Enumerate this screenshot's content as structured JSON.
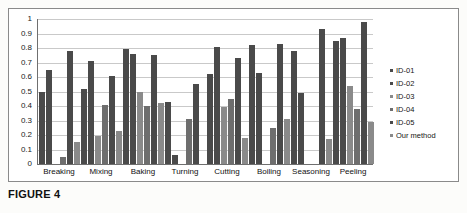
{
  "caption": "FIGURE 4",
  "chart_data": {
    "type": "bar",
    "title": "",
    "xlabel": "",
    "ylabel": "",
    "ylim": [
      0,
      1
    ],
    "yticks": [
      "1",
      "0.9",
      "0.8",
      "0.7",
      "0.6",
      "0.5",
      "0.4",
      "0.3",
      "0.2",
      "0.1",
      "0"
    ],
    "ytick_values": [
      1,
      0.9,
      0.8,
      0.7,
      0.6,
      0.5,
      0.4,
      0.3,
      0.2,
      0.1,
      0
    ],
    "grid": true,
    "legend_position": "right",
    "categories": [
      "Breaking",
      "Mixing",
      "Baking",
      "Turning",
      "Cutting",
      "Boiling",
      "Seasoning",
      "Peeling"
    ],
    "series": [
      {
        "name": "ID-01",
        "color": "#4a4a4a",
        "values": [
          0.5,
          0.52,
          0.79,
          0.43,
          0.62,
          0.82,
          0.78,
          0.85
        ]
      },
      {
        "name": "ID-02",
        "color": "#4a4a4a",
        "values": [
          0.65,
          0.71,
          0.76,
          0.06,
          0.81,
          0.63,
          0.49,
          0.87
        ]
      },
      {
        "name": "ID-03",
        "color": "#8a8a8a",
        "values": [
          0.0,
          0.19,
          0.5,
          0.0,
          0.39,
          0.0,
          0.0,
          0.54
        ]
      },
      {
        "name": "ID-04",
        "color": "#6e6e6e",
        "values": [
          0.05,
          0.41,
          0.4,
          0.31,
          0.45,
          0.25,
          0.0,
          0.38
        ]
      },
      {
        "name": "ID-05",
        "color": "#4a4a4a",
        "values": [
          0.78,
          0.61,
          0.75,
          0.55,
          0.73,
          0.83,
          0.93,
          0.98
        ]
      },
      {
        "name": "Our method",
        "color": "#8a8a8a",
        "values": [
          0.15,
          0.23,
          0.42,
          0.0,
          0.18,
          0.31,
          0.17,
          0.29
        ]
      }
    ]
  },
  "legend": {
    "items": [
      {
        "label": "ID-01"
      },
      {
        "label": "ID-02"
      },
      {
        "label": "ID-03"
      },
      {
        "label": "ID-04"
      },
      {
        "label": "ID-05"
      },
      {
        "label": "Our method"
      }
    ]
  }
}
